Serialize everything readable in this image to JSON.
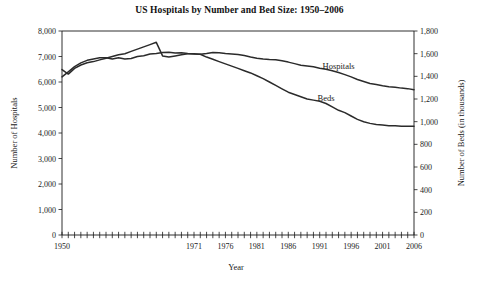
{
  "chart_data": {
    "type": "line",
    "title": "US Hospitals by Number and Bed Size: 1950–2006",
    "xlabel": "Year",
    "ylabel": "Number of Hospitals",
    "y2label": "Number of Beds (in thousands)",
    "grid": false,
    "legend": "inline-labels",
    "xlim": [
      1950,
      2006
    ],
    "ylim": [
      0,
      8000
    ],
    "y2lim": [
      0,
      1800
    ],
    "yticks": [
      "0",
      "1,000",
      "2,000",
      "3,000",
      "4,000",
      "5,000",
      "6,000",
      "7,000",
      "8,000"
    ],
    "ytick_values": [
      0,
      1000,
      2000,
      3000,
      4000,
      5000,
      6000,
      7000,
      8000
    ],
    "y2ticks": [
      "0",
      "200",
      "400",
      "600",
      "800",
      "1,000",
      "1,200",
      "1,400",
      "1,600",
      "1,800"
    ],
    "y2tick_values": [
      0,
      200,
      400,
      600,
      800,
      1000,
      1200,
      1400,
      1600,
      1800
    ],
    "xticks": [
      "1950",
      "1971",
      "1976",
      "1981",
      "1986",
      "1991",
      "1996",
      "2001",
      "2006"
    ],
    "xtick_values": [
      1950,
      1971,
      1976,
      1981,
      1986,
      1991,
      1996,
      2001,
      2006
    ],
    "x_minor_tick_step": 1,
    "x": [
      1950,
      1951,
      1952,
      1953,
      1954,
      1955,
      1956,
      1957,
      1958,
      1959,
      1960,
      1961,
      1962,
      1963,
      1964,
      1965,
      1966,
      1967,
      1968,
      1969,
      1970,
      1971,
      1972,
      1973,
      1974,
      1975,
      1976,
      1977,
      1978,
      1979,
      1980,
      1981,
      1982,
      1983,
      1984,
      1985,
      1986,
      1987,
      1988,
      1989,
      1990,
      1991,
      1992,
      1993,
      1994,
      1995,
      1996,
      1997,
      1998,
      1999,
      2000,
      2001,
      2002,
      2003,
      2004,
      2005,
      2006
    ],
    "series": [
      {
        "name": "Hospitals",
        "axis": "left",
        "units": "hospitals",
        "label_position": {
          "x": 1994,
          "y": 6500
        },
        "values": [
          6200,
          6400,
          6600,
          6750,
          6850,
          6900,
          6950,
          6950,
          6900,
          6950,
          6900,
          6920,
          7000,
          7030,
          7100,
          7120,
          7160,
          7170,
          7140,
          7150,
          7120,
          7100,
          7090,
          7120,
          7160,
          7150,
          7120,
          7100,
          7080,
          7040,
          6980,
          6930,
          6900,
          6880,
          6870,
          6830,
          6780,
          6720,
          6660,
          6630,
          6600,
          6540,
          6500,
          6440,
          6370,
          6290,
          6200,
          6100,
          6020,
          5940,
          5900,
          5850,
          5810,
          5790,
          5760,
          5740,
          5700
        ]
      },
      {
        "name": "Beds",
        "axis": "right",
        "units": "thousands of beds",
        "label_position": {
          "x": 1992,
          "y": 1180
        },
        "values": [
          1460,
          1420,
          1470,
          1500,
          1520,
          1530,
          1545,
          1560,
          1575,
          1590,
          1600,
          1620,
          1640,
          1660,
          1680,
          1700,
          1580,
          1570,
          1580,
          1590,
          1600,
          1600,
          1595,
          1570,
          1550,
          1530,
          1510,
          1490,
          1470,
          1450,
          1430,
          1405,
          1380,
          1350,
          1320,
          1290,
          1260,
          1240,
          1220,
          1200,
          1190,
          1180,
          1160,
          1130,
          1100,
          1080,
          1050,
          1020,
          1000,
          985,
          975,
          970,
          965,
          965,
          960,
          960,
          960
        ]
      }
    ]
  }
}
